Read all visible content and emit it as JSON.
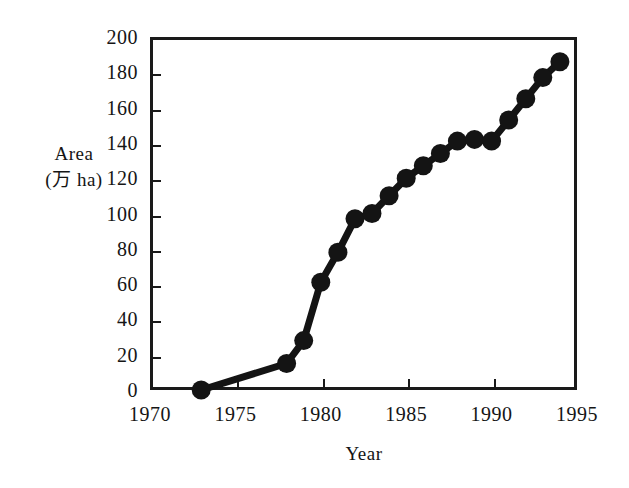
{
  "figure": {
    "background": "#ffffff",
    "ink_color": "#1a1a1a",
    "marker_color": "#141414"
  },
  "chart_data": {
    "type": "line",
    "title": "",
    "xlabel": "Year",
    "ylabel": "Area (万 ha)",
    "ylabel_line1": "Area",
    "ylabel_line2": "(万 ha)",
    "xlim": [
      1970,
      1995
    ],
    "ylim": [
      0,
      200
    ],
    "grid": false,
    "legend": "none",
    "marker": "filled-circle",
    "xticks": [
      1970,
      1975,
      1980,
      1985,
      1990,
      1995
    ],
    "xtick_labels": [
      "1970",
      "1975",
      "1980",
      "1985",
      "1990",
      "1995"
    ],
    "yticks": [
      0,
      20,
      40,
      60,
      80,
      100,
      120,
      140,
      160,
      180,
      200
    ],
    "ytick_labels": [
      "0",
      "20",
      "40",
      "60",
      "80",
      "100",
      "120",
      "140",
      "160",
      "180",
      "200"
    ],
    "x": [
      1973,
      1978,
      1979,
      1980,
      1981,
      1982,
      1983,
      1984,
      1985,
      1986,
      1987,
      1988,
      1989,
      1990,
      1991,
      1992,
      1993,
      1994
    ],
    "values": [
      0,
      15,
      28,
      61,
      78,
      97,
      100,
      110,
      120,
      127,
      134,
      141,
      142,
      141,
      153,
      165,
      177,
      186
    ],
    "series": [
      {
        "name": "Area",
        "points": [
          {
            "year": 1973,
            "value": 0
          },
          {
            "year": 1978,
            "value": 15
          },
          {
            "year": 1979,
            "value": 28
          },
          {
            "year": 1980,
            "value": 61
          },
          {
            "year": 1981,
            "value": 78
          },
          {
            "year": 1982,
            "value": 97
          },
          {
            "year": 1983,
            "value": 100
          },
          {
            "year": 1984,
            "value": 110
          },
          {
            "year": 1985,
            "value": 120
          },
          {
            "year": 1986,
            "value": 127
          },
          {
            "year": 1987,
            "value": 134
          },
          {
            "year": 1988,
            "value": 141
          },
          {
            "year": 1989,
            "value": 142
          },
          {
            "year": 1990,
            "value": 141
          },
          {
            "year": 1991,
            "value": 153
          },
          {
            "year": 1992,
            "value": 165
          },
          {
            "year": 1993,
            "value": 177
          },
          {
            "year": 1994,
            "value": 186
          }
        ]
      }
    ]
  }
}
